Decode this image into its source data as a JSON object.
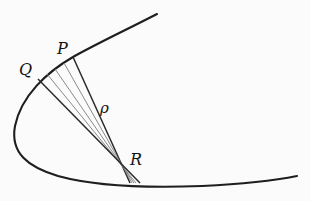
{
  "figure": {
    "labels": {
      "p": "P",
      "q": "Q",
      "rho": "ρ",
      "r": "R"
    },
    "colors": {
      "background": "#fbfbfb",
      "curve": "#1e1e1e",
      "radius_thick": "#2a2a2a",
      "radius_thin": "#7d7d7d",
      "label_text": "#141414"
    }
  }
}
